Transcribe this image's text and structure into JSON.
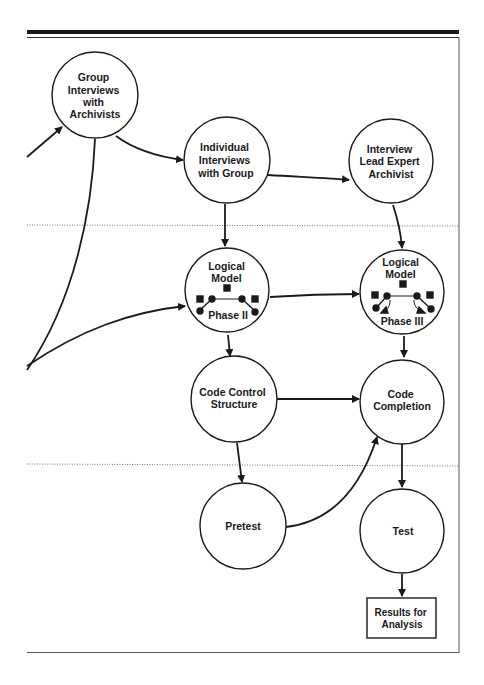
{
  "nodes": {
    "group_interviews": {
      "lines": [
        "Group",
        "Interviews",
        "with",
        "Archivists"
      ]
    },
    "individual_interviews": {
      "lines": [
        "Individual",
        "Interviews",
        "with Group"
      ]
    },
    "interview_lead": {
      "lines": [
        "Interview",
        "Lead Expert",
        "Archivist"
      ]
    },
    "logical_model_2": {
      "lines": [
        "Logical",
        "Model"
      ],
      "phase": "Phase II"
    },
    "logical_model_3": {
      "lines": [
        "Logical",
        "Model"
      ],
      "phase": "Phase III"
    },
    "code_control": {
      "lines": [
        "Code Control",
        "Structure"
      ]
    },
    "code_completion": {
      "lines": [
        "Code",
        "Completion"
      ]
    },
    "pretest": {
      "lines": [
        "Pretest"
      ]
    },
    "test": {
      "lines": [
        "Test"
      ]
    },
    "results": {
      "lines": [
        "Results for",
        "Analysis"
      ]
    }
  },
  "colors": {
    "stroke": "#1a1a1a",
    "background": "#ffffff",
    "dotted": "#777777"
  }
}
